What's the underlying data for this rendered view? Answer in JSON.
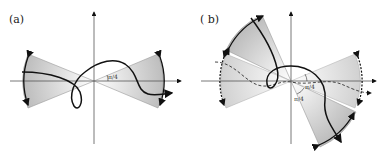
{
  "panels": [
    {
      "label": "(a)",
      "angle_labels": [
        "π/4"
      ]
    },
    {
      "label": "( b)",
      "angle_labels": [
        "π/4",
        "π/4"
      ]
    }
  ]
}
